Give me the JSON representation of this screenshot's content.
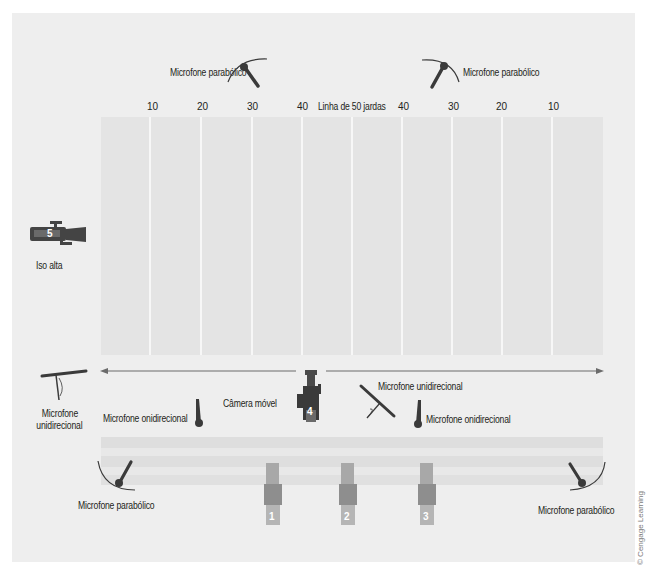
{
  "diagram": {
    "yard_labels": [
      "10",
      "20",
      "30",
      "40",
      "Linha de 50 jardas",
      "40",
      "30",
      "20",
      "10"
    ],
    "labels": {
      "parabolic_top_left": "Microfone parabólico",
      "parabolic_top_right": "Microfone parabólico",
      "parabolic_bottom_left": "Microfone parabólico",
      "parabolic_bottom_right": "Microfone parabólico",
      "unidirectional_left_line1": "Microfone",
      "unidirectional_left_line2": "unidirecional",
      "omni_left": "Microfone onidirecional",
      "mobile_camera": "Câmera móvel",
      "unidirectional_right": "Microfone unidirecional",
      "omni_right": "Microfone onidirecional",
      "iso_high": "Iso alta"
    },
    "cameras": [
      {
        "id": "1",
        "number": "1"
      },
      {
        "id": "2",
        "number": "2"
      },
      {
        "id": "3",
        "number": "3"
      },
      {
        "id": "4",
        "number": "4",
        "label": "Câmera móvel"
      },
      {
        "id": "5",
        "number": "5",
        "label": "Iso alta"
      }
    ],
    "credit": "© Cengage Learning",
    "colors": {
      "background_panel": "#eeeeee",
      "field": "#e4e4e4",
      "yard_line": "#f7f7f7",
      "mic": "#3a3a3a",
      "camera_dark": "#555555",
      "camera_light": "#a8a8a8",
      "arrow": "#6b6b6b"
    }
  }
}
